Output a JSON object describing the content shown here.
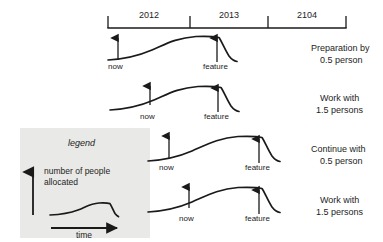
{
  "diagram": {
    "timeline": {
      "name": "year-axis",
      "ticks": [
        {
          "x": 108
        },
        {
          "x": 190
        },
        {
          "x": 268
        },
        {
          "x": 346
        }
      ],
      "years": [
        {
          "label": "2012",
          "center": 149
        },
        {
          "label": "2013",
          "center": 229
        },
        {
          "label": "2104",
          "center": 307
        }
      ],
      "axis_y": 28,
      "tick_top": 16,
      "label_y": 12
    },
    "rows": [
      {
        "id": "row-1",
        "now_label": "now",
        "feature_label": "feature",
        "now_x": 118,
        "feature_x": 217,
        "baseline_y": 60,
        "label_y": 63,
        "right_label_line1": "Preparation by",
        "right_label_line2": "0.5 person",
        "right_label_y": 43
      },
      {
        "id": "row-2",
        "now_label": "now",
        "feature_label": "feature",
        "now_x": 150,
        "feature_x": 218,
        "baseline_y": 110,
        "label_y": 113,
        "right_label_line1": "Work with",
        "right_label_line2": "1.5 persons",
        "right_label_y": 93
      },
      {
        "id": "row-3",
        "now_label": "now",
        "feature_label": "feature",
        "now_x": 169,
        "feature_x": 259,
        "baseline_y": 161,
        "label_y": 164,
        "right_label_line1": "Continue with",
        "right_label_line2": "0.5 person",
        "right_label_y": 144
      },
      {
        "id": "row-4",
        "now_label": "now",
        "feature_label": "feature",
        "now_x": 189,
        "feature_x": 259,
        "baseline_y": 212,
        "label_y": 215,
        "right_label_line1": "Work with",
        "right_label_line2": "1.5 persons",
        "right_label_y": 195
      }
    ],
    "legend": {
      "title": "legend",
      "y_axis_line1": "number of people",
      "y_axis_line2": "allocated",
      "x_axis_label": "time",
      "box": {
        "x": 20,
        "y": 128,
        "w": 130,
        "h": 110
      },
      "bg_color": "#e9e9e7"
    },
    "colors": {
      "ink": "#1a1a1a",
      "paper": "#ffffff",
      "legend_bg": "#e9e9e7"
    }
  },
  "chart_data": {
    "type": "line",
    "xlabel": "time",
    "ylabel": "number of people allocated",
    "x_tick_labels": [
      "2012",
      "2013",
      "2104"
    ],
    "legend_position": "lower-left",
    "grid": false,
    "series": [
      {
        "name": "Preparation by 0.5 person",
        "markers": [
          {
            "label": "now",
            "x": 118
          },
          {
            "label": "feature",
            "x": 217
          }
        ],
        "values": [
          0.05,
          0.12,
          0.3,
          0.48,
          0.55,
          0.56,
          0.52,
          0.18
        ]
      },
      {
        "name": "Work with 1.5 persons",
        "markers": [
          {
            "label": "now",
            "x": 150
          },
          {
            "label": "feature",
            "x": 218
          }
        ],
        "values": [
          0.05,
          0.12,
          0.3,
          0.48,
          0.55,
          0.56,
          0.52,
          0.18
        ]
      },
      {
        "name": "Continue with 0.5 person",
        "markers": [
          {
            "label": "now",
            "x": 169
          },
          {
            "label": "feature",
            "x": 259
          }
        ],
        "values": [
          0.05,
          0.12,
          0.3,
          0.48,
          0.55,
          0.56,
          0.52,
          0.18
        ]
      },
      {
        "name": "Work with 1.5 persons",
        "markers": [
          {
            "label": "now",
            "x": 189
          },
          {
            "label": "feature",
            "x": 259
          }
        ],
        "values": [
          0.05,
          0.12,
          0.3,
          0.48,
          0.55,
          0.56,
          0.52,
          0.18
        ]
      }
    ]
  }
}
